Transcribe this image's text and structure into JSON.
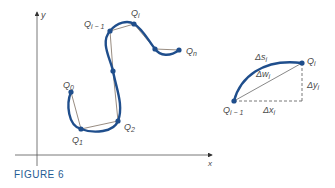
{
  "figure": {
    "caption": "FIGURE 6",
    "colors": {
      "curve": "#1f4e8c",
      "axis": "#4a4a4a",
      "chord": "#6b5a4a",
      "caption": "#1f5c93"
    }
  },
  "main_plot": {
    "x_axis_label": "x",
    "y_axis_label": "y",
    "points": {
      "q0": {
        "base": "Q",
        "sub": "0"
      },
      "q1": {
        "base": "Q",
        "sub": "1"
      },
      "q2": {
        "base": "Q",
        "sub": "2"
      },
      "qim1": {
        "base": "Q",
        "sub": "i − 1"
      },
      "qi": {
        "base": "Q",
        "sub": "i"
      },
      "qn": {
        "base": "Q",
        "sub": "n"
      }
    }
  },
  "detail": {
    "q_start": {
      "base": "Q",
      "sub": "i − 1"
    },
    "q_end": {
      "base": "Q",
      "sub": "i"
    },
    "arc_label": {
      "base": "Δs",
      "sub": "i"
    },
    "chord_label": {
      "base": "Δw",
      "sub": "i"
    },
    "dx_label": {
      "base": "Δx",
      "sub": "i"
    },
    "dy_label": {
      "base": "Δy",
      "sub": "i"
    }
  }
}
